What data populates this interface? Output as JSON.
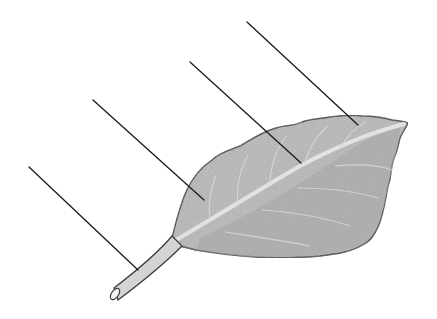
{
  "diagram": {
    "colors": {
      "background": "#ffffff",
      "blade_fill": "#b8b8b8",
      "blade_shadow": "#a6a6a6",
      "outline": "#3a3a3a",
      "midrib": "#e2e2e2",
      "petiole_fill": "#d4d4d4",
      "pointer_line": "#1a1a1a"
    },
    "pointer_lines": [
      {
        "id": "1",
        "target": "petiole",
        "x1": 29,
        "y1": 167,
        "x2": 138,
        "y2": 270
      },
      {
        "id": "2",
        "target": "blade-lower",
        "x1": 93,
        "y1": 100,
        "x2": 204,
        "y2": 200
      },
      {
        "id": "3",
        "target": "midrib",
        "x1": 190,
        "y1": 62,
        "x2": 301,
        "y2": 163
      },
      {
        "id": "4",
        "target": "blade-tip",
        "x1": 247,
        "y1": 22,
        "x2": 358,
        "y2": 125
      }
    ],
    "labels": []
  }
}
